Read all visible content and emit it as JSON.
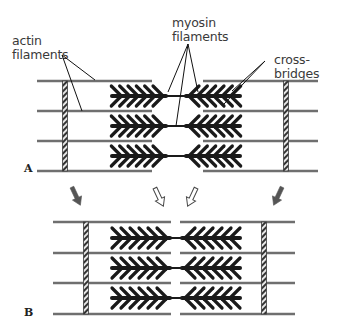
{
  "labels": {
    "actin": [
      "actin",
      "filaments"
    ],
    "myosin": [
      "myosin",
      "filaments"
    ],
    "cross_bridges": "cross-bridges"
  },
  "panels": [
    {
      "id": "A",
      "letter": "A",
      "state": "relaxed"
    },
    {
      "id": "B",
      "letter": "B",
      "state": "contracted"
    }
  ],
  "colors": {
    "actin": "#6f6f6f",
    "myosin": "#1a1a1a",
    "z_disc": "#3c3c3c",
    "arrow_solid": "#555555",
    "arrow_outline": "#444444",
    "leader": "#111111",
    "text": "#3a3a3a"
  },
  "arrows": [
    {
      "type": "solid",
      "direction": "down-right",
      "position": "left"
    },
    {
      "type": "outline",
      "direction": "down-right",
      "position": "center-left"
    },
    {
      "type": "outline",
      "direction": "down-left",
      "position": "center-right"
    },
    {
      "type": "solid",
      "direction": "down-left",
      "position": "right"
    }
  ]
}
